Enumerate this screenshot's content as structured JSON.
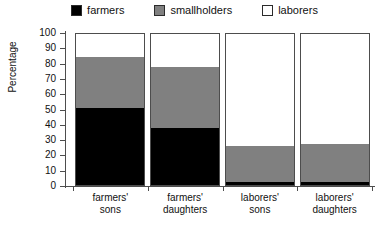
{
  "chart_data": {
    "type": "bar",
    "subtype": "stacked-column-100",
    "title": "",
    "xlabel": "",
    "ylabel": "Percentage",
    "ylim": [
      0,
      100
    ],
    "ytick_step": 10,
    "yticks": [
      0,
      10,
      20,
      30,
      40,
      50,
      60,
      70,
      80,
      90,
      100
    ],
    "grid": false,
    "legend_position": "top-center",
    "categories": [
      "farmers' sons",
      "farmers' daughters",
      "laborers' sons",
      "laborers' daughters"
    ],
    "category_lines": [
      [
        "farmers'",
        "sons"
      ],
      [
        "farmers'",
        "daughters"
      ],
      [
        "laborers'",
        "sons"
      ],
      [
        "laborers'",
        "daughters"
      ]
    ],
    "series": [
      {
        "name": "farmers",
        "color": "#000000",
        "values": [
          51,
          38,
          2,
          2
        ]
      },
      {
        "name": "smallholders",
        "color": "#808080",
        "values": [
          34,
          40,
          24,
          25
        ]
      },
      {
        "name": "laborers",
        "color": "#ffffff",
        "values": [
          15,
          22,
          74,
          73
        ]
      }
    ]
  },
  "legend": {
    "items": [
      {
        "label": "farmers",
        "color": "#000000"
      },
      {
        "label": "smallholders",
        "color": "#808080"
      },
      {
        "label": "laborers",
        "color": "#ffffff"
      }
    ]
  },
  "axes": {
    "y_title": "Percentage",
    "y_tick_labels": [
      "100",
      "90",
      "80",
      "70",
      "60",
      "50",
      "40",
      "30",
      "20",
      "10",
      "0"
    ]
  }
}
